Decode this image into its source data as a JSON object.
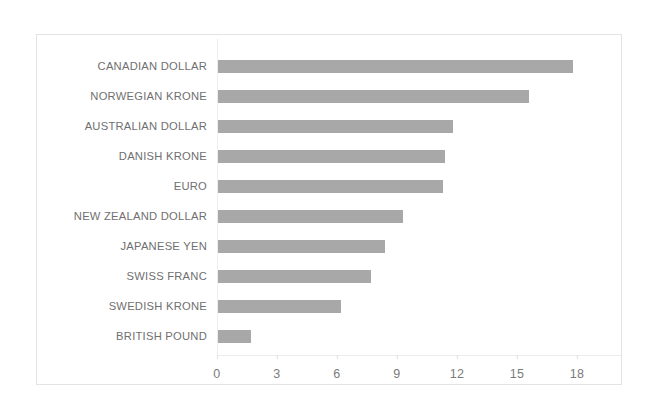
{
  "chart_data": {
    "type": "bar",
    "orientation": "horizontal",
    "title": "",
    "subtitle": "",
    "xlabel": "",
    "ylabel": "",
    "categories": [
      "CANADIAN DOLLAR",
      "NORWEGIAN KRONE",
      "AUSTRALIAN DOLLAR",
      "DANISH KRONE",
      "EURO",
      "NEW ZEALAND DOLLAR",
      "JAPANESE YEN",
      "SWISS FRANC",
      "SWEDISH KRONE",
      "BRITISH POUND"
    ],
    "values": [
      17.8,
      15.6,
      11.8,
      11.4,
      11.3,
      9.3,
      8.4,
      7.7,
      6.2,
      1.7
    ],
    "xlim": [
      0,
      18
    ],
    "xticks": [
      0,
      3,
      6,
      9,
      12,
      15,
      18
    ],
    "xtick_labels": [
      "0",
      "3",
      "6",
      "9",
      "12",
      "15",
      "18"
    ],
    "grid": false,
    "legend": false,
    "legend_position": "none",
    "series": [
      {
        "name": "",
        "values": [
          17.8,
          15.6,
          11.8,
          11.4,
          11.3,
          9.3,
          8.4,
          7.7,
          6.2,
          1.7
        ]
      }
    ],
    "colors": {
      "bar": "#a8a8a8",
      "axis_text": "#7b7b7b",
      "label_text": "#6f6f6f",
      "frame_border": "#e3e3e3",
      "background": "#ffffff"
    }
  }
}
